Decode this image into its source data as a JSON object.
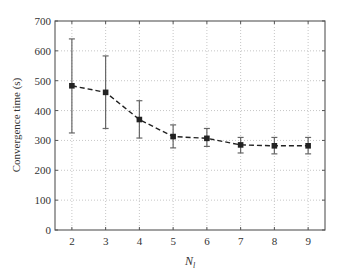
{
  "chart_data": {
    "type": "line",
    "title": "",
    "xlabel": "N_l",
    "xlabel_main": "N",
    "xlabel_sub": "l",
    "ylabel": "Convergence time (s)",
    "x": [
      2,
      3,
      4,
      5,
      6,
      7,
      8,
      9
    ],
    "series": [
      {
        "name": "Convergence time",
        "values": [
          483,
          461,
          370,
          313,
          307,
          285,
          282,
          282
        ],
        "error_low": [
          325,
          340,
          308,
          275,
          280,
          258,
          255,
          255
        ],
        "error_high": [
          640,
          583,
          433,
          352,
          340,
          310,
          310,
          310
        ],
        "line_style": "dashed",
        "marker": "filled-square",
        "color": "#222222"
      }
    ],
    "xlim": [
      1.5,
      9.5
    ],
    "ylim": [
      0,
      700
    ],
    "xticks": [
      2,
      3,
      4,
      5,
      6,
      7,
      8,
      9
    ],
    "yticks": [
      0,
      100,
      200,
      300,
      400,
      500,
      600,
      700
    ],
    "grid": true,
    "grid_style": "dotted",
    "legend": null
  },
  "labels": {
    "ylabel": "Convergence time (s)",
    "xlabel_main": "N",
    "xlabel_sub": "l"
  }
}
